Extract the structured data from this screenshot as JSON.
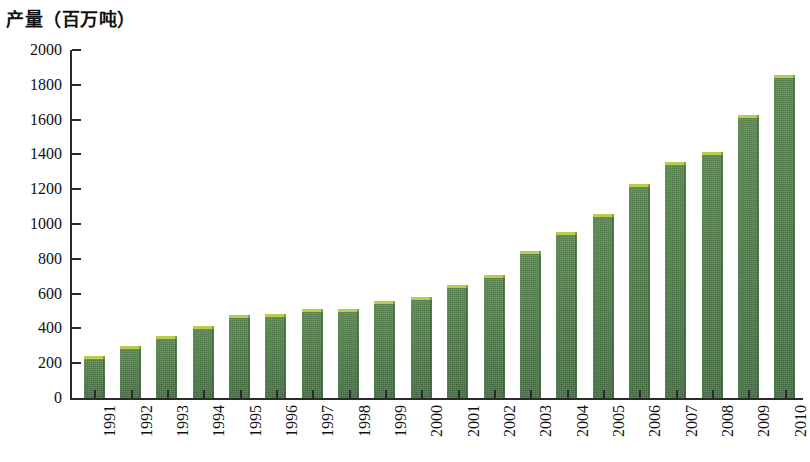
{
  "chart_data": {
    "type": "bar",
    "title": "产量（百万吨）",
    "xlabel": "",
    "ylabel": "产量（百万吨）",
    "ylim": [
      0,
      2000
    ],
    "ytick_step": 200,
    "yticks": [
      "0",
      "200",
      "400",
      "600",
      "800",
      "1000",
      "1200",
      "1400",
      "1600",
      "1800",
      "2000"
    ],
    "grid": false,
    "legend": "none",
    "bar_color": "#4e7a4b",
    "bar_highlight_color": "#b9cc4e",
    "axis_color": "#2b2b2b",
    "categories": [
      "1991",
      "1992",
      "1993",
      "1994",
      "1995",
      "1996",
      "1997",
      "1998",
      "1999",
      "2000",
      "2001",
      "2002",
      "2003",
      "2004",
      "2005",
      "2006",
      "2007",
      "2008",
      "2009",
      "2010"
    ],
    "values": [
      240,
      300,
      355,
      415,
      475,
      480,
      510,
      510,
      560,
      580,
      650,
      705,
      845,
      955,
      1055,
      1230,
      1355,
      1415,
      1625,
      1855
    ]
  }
}
